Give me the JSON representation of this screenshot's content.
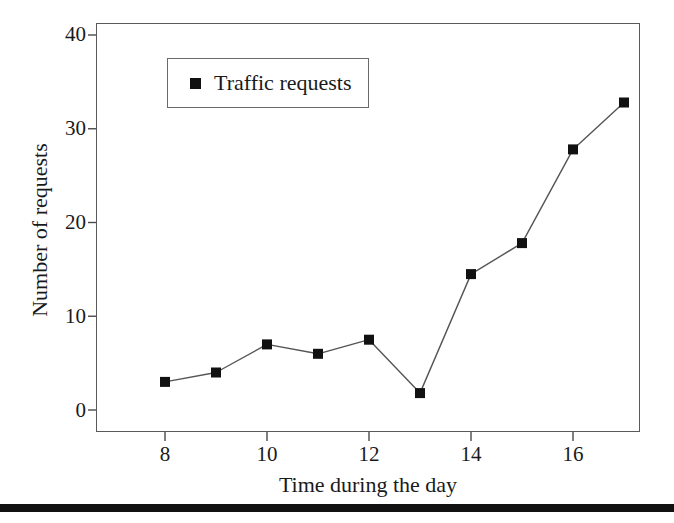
{
  "chart_data": {
    "type": "line",
    "title": "",
    "xlabel": "Time during the day",
    "ylabel": "Number of requests",
    "x": [
      8,
      9,
      10,
      11,
      12,
      13,
      14,
      15,
      16,
      17
    ],
    "values": [
      3,
      4,
      7,
      6,
      7.5,
      1.8,
      14.5,
      17.8,
      27.8,
      32.8
    ],
    "series": [
      {
        "name": "Traffic requests",
        "values": [
          3,
          4,
          7,
          6,
          7.5,
          1.8,
          14.5,
          17.8,
          27.8,
          32.8
        ]
      }
    ],
    "xlim": [
      7.4,
      17.9
    ],
    "ylim": [
      -2.2,
      41.5
    ],
    "xticks": [
      8,
      10,
      12,
      14,
      16
    ],
    "xtick_labels": [
      "8",
      "10",
      "12",
      "14",
      "16"
    ],
    "yticks": [
      0,
      10,
      20,
      30,
      40
    ],
    "ytick_labels": [
      "0",
      "10",
      "20",
      "30",
      "40"
    ],
    "grid": false,
    "legend_position": "upper-left-inside",
    "marker": "square",
    "marker_color": "#111111",
    "line_color": "#555555",
    "frame_color": "#5a5a5a",
    "background_color": "#ffffff"
  },
  "legend": {
    "entries": [
      {
        "label": "Traffic requests",
        "marker": "filled-square-marker",
        "color": "#111111"
      }
    ]
  },
  "axes": {
    "y_title": "Number of requests",
    "x_title": "Time during the day"
  },
  "decorations": {
    "bottom_rule_color": "#111111"
  }
}
